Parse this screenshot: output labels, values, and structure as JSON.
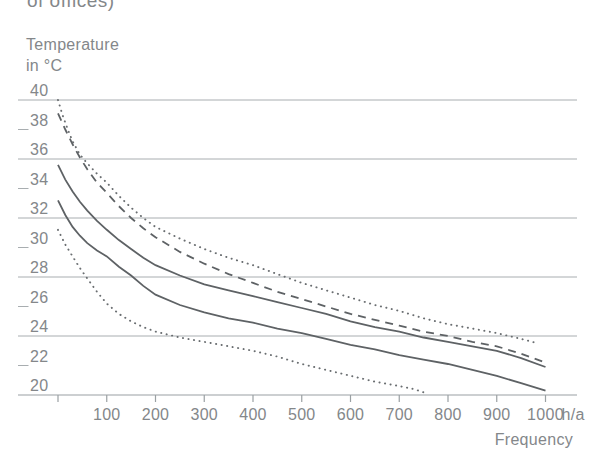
{
  "page": {
    "clipped_caption": "of offices)"
  },
  "chart_data": {
    "type": "line",
    "title_lines": [
      "Temperature",
      "in °C"
    ],
    "xlabel": "Frequency",
    "x_unit": "h/a",
    "xlim": [
      0,
      1000
    ],
    "ylim": [
      20,
      40
    ],
    "grid": "horizontal-only",
    "legend": "none",
    "colors": {
      "line": "#5e6265",
      "grid": "#a8adb0",
      "text": "#84878a",
      "background": "#ffffff"
    },
    "y_axis": {
      "major_gridline_values": [
        40,
        36,
        32,
        28,
        24,
        20
      ],
      "minor_tick_values": [
        38,
        34,
        30,
        26,
        22
      ],
      "labels": [
        40,
        38,
        36,
        34,
        32,
        30,
        28,
        26,
        24,
        22,
        20
      ]
    },
    "x_axis": {
      "tick_values": [
        0,
        100,
        200,
        300,
        400,
        500,
        600,
        700,
        800,
        900,
        1000
      ],
      "tick_labels": [
        "",
        "100",
        "200",
        "300",
        "400",
        "500",
        "600",
        "700",
        "800",
        "900",
        "1000"
      ]
    },
    "series": [
      {
        "name": "max-envelope-dotted",
        "style": "dotted",
        "points": [
          [
            0,
            40.0
          ],
          [
            10,
            38.9
          ],
          [
            20,
            38.0
          ],
          [
            30,
            37.2
          ],
          [
            45,
            36.3
          ],
          [
            60,
            35.7
          ],
          [
            80,
            35.0
          ],
          [
            100,
            34.4
          ],
          [
            125,
            33.5
          ],
          [
            150,
            32.7
          ],
          [
            175,
            32.0
          ],
          [
            200,
            31.4
          ],
          [
            250,
            30.6
          ],
          [
            300,
            29.9
          ],
          [
            350,
            29.3
          ],
          [
            400,
            28.8
          ],
          [
            450,
            28.2
          ],
          [
            500,
            27.6
          ],
          [
            550,
            27.1
          ],
          [
            600,
            26.6
          ],
          [
            650,
            26.1
          ],
          [
            700,
            25.7
          ],
          [
            750,
            25.2
          ],
          [
            800,
            24.8
          ],
          [
            850,
            24.5
          ],
          [
            900,
            24.2
          ],
          [
            950,
            23.8
          ],
          [
            985,
            23.5
          ]
        ]
      },
      {
        "name": "upper-dashed",
        "style": "dashed",
        "points": [
          [
            0,
            39.1
          ],
          [
            15,
            38.0
          ],
          [
            30,
            37.0
          ],
          [
            45,
            36.1
          ],
          [
            60,
            35.3
          ],
          [
            80,
            34.4
          ],
          [
            100,
            33.7
          ],
          [
            125,
            32.8
          ],
          [
            150,
            32.0
          ],
          [
            175,
            31.3
          ],
          [
            200,
            30.7
          ],
          [
            250,
            29.7
          ],
          [
            300,
            28.9
          ],
          [
            350,
            28.2
          ],
          [
            400,
            27.6
          ],
          [
            450,
            27.0
          ],
          [
            500,
            26.5
          ],
          [
            550,
            26.0
          ],
          [
            600,
            25.5
          ],
          [
            650,
            25.1
          ],
          [
            700,
            24.7
          ],
          [
            750,
            24.3
          ],
          [
            800,
            24.0
          ],
          [
            850,
            23.6
          ],
          [
            900,
            23.3
          ],
          [
            950,
            22.8
          ],
          [
            1000,
            22.2
          ]
        ]
      },
      {
        "name": "upper-solid",
        "style": "solid",
        "points": [
          [
            0,
            35.6
          ],
          [
            15,
            34.6
          ],
          [
            30,
            33.8
          ],
          [
            45,
            33.1
          ],
          [
            60,
            32.5
          ],
          [
            80,
            31.8
          ],
          [
            100,
            31.2
          ],
          [
            125,
            30.5
          ],
          [
            150,
            29.9
          ],
          [
            175,
            29.3
          ],
          [
            200,
            28.8
          ],
          [
            250,
            28.1
          ],
          [
            300,
            27.5
          ],
          [
            350,
            27.1
          ],
          [
            400,
            26.7
          ],
          [
            450,
            26.3
          ],
          [
            500,
            25.9
          ],
          [
            550,
            25.5
          ],
          [
            600,
            25.0
          ],
          [
            650,
            24.6
          ],
          [
            700,
            24.3
          ],
          [
            750,
            23.9
          ],
          [
            800,
            23.6
          ],
          [
            850,
            23.3
          ],
          [
            900,
            23.0
          ],
          [
            950,
            22.5
          ],
          [
            1000,
            21.9
          ]
        ]
      },
      {
        "name": "lower-solid",
        "style": "solid",
        "points": [
          [
            0,
            33.2
          ],
          [
            15,
            32.2
          ],
          [
            30,
            31.4
          ],
          [
            45,
            30.8
          ],
          [
            60,
            30.3
          ],
          [
            80,
            29.8
          ],
          [
            100,
            29.4
          ],
          [
            125,
            28.7
          ],
          [
            150,
            28.1
          ],
          [
            175,
            27.4
          ],
          [
            200,
            26.8
          ],
          [
            250,
            26.1
          ],
          [
            300,
            25.6
          ],
          [
            350,
            25.2
          ],
          [
            400,
            24.9
          ],
          [
            450,
            24.5
          ],
          [
            500,
            24.2
          ],
          [
            550,
            23.8
          ],
          [
            600,
            23.4
          ],
          [
            650,
            23.1
          ],
          [
            700,
            22.7
          ],
          [
            750,
            22.4
          ],
          [
            800,
            22.1
          ],
          [
            850,
            21.7
          ],
          [
            900,
            21.3
          ],
          [
            950,
            20.8
          ],
          [
            1000,
            20.3
          ]
        ]
      },
      {
        "name": "min-envelope-dotted",
        "style": "dotted",
        "points": [
          [
            0,
            31.2
          ],
          [
            15,
            30.2
          ],
          [
            30,
            29.4
          ],
          [
            45,
            28.6
          ],
          [
            60,
            27.9
          ],
          [
            80,
            27.0
          ],
          [
            100,
            26.2
          ],
          [
            125,
            25.5
          ],
          [
            150,
            25.0
          ],
          [
            175,
            24.6
          ],
          [
            200,
            24.3
          ],
          [
            250,
            23.9
          ],
          [
            300,
            23.6
          ],
          [
            350,
            23.3
          ],
          [
            400,
            23.0
          ],
          [
            450,
            22.6
          ],
          [
            500,
            22.1
          ],
          [
            550,
            21.7
          ],
          [
            600,
            21.3
          ],
          [
            650,
            20.9
          ],
          [
            700,
            20.6
          ],
          [
            730,
            20.4
          ],
          [
            757,
            20.1
          ]
        ]
      }
    ]
  }
}
